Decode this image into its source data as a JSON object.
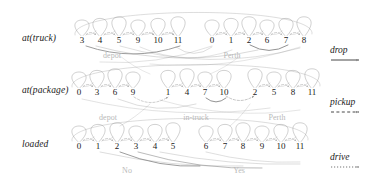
{
  "figure": {
    "type": "decision-diagram",
    "background": "#ffffff",
    "ink": "#1a1a1a",
    "edge_color": "#8c8c8c",
    "group_label_color": "#b9b9b9"
  },
  "rows": [
    {
      "id": "at-truck",
      "label": "at(truck)",
      "y": 40,
      "nodes": [
        {
          "v": "3",
          "x": 82
        },
        {
          "v": "4",
          "x": 100
        },
        {
          "v": "5",
          "x": 119
        },
        {
          "v": "9",
          "x": 138
        },
        {
          "v": "10",
          "x": 158
        },
        {
          "v": "11",
          "x": 178
        },
        {
          "v": "0",
          "x": 212
        },
        {
          "v": "1",
          "x": 231
        },
        {
          "v": "2",
          "x": 249
        },
        {
          "v": "6",
          "x": 267
        },
        {
          "v": "7",
          "x": 286
        },
        {
          "v": "8",
          "x": 304
        }
      ],
      "groups": [
        {
          "text": "depot",
          "x": 112,
          "y": 51
        },
        {
          "text": "Perth",
          "x": 232,
          "y": 51
        }
      ]
    },
    {
      "id": "at-package",
      "label": "at(package)",
      "y": 92,
      "nodes": [
        {
          "v": "0",
          "x": 79
        },
        {
          "v": "3",
          "x": 97
        },
        {
          "v": "6",
          "x": 115
        },
        {
          "v": "9",
          "x": 133
        },
        {
          "v": "1",
          "x": 168
        },
        {
          "v": "4",
          "x": 187
        },
        {
          "v": "7",
          "x": 205
        },
        {
          "v": "10",
          "x": 224
        },
        {
          "v": "2",
          "x": 255
        },
        {
          "v": "5",
          "x": 274
        },
        {
          "v": "8",
          "x": 293
        },
        {
          "v": "11",
          "x": 312
        }
      ],
      "groups": [
        {
          "text": "depot",
          "x": 108,
          "y": 113
        },
        {
          "text": "in-truck",
          "x": 196,
          "y": 113
        },
        {
          "text": "Perth",
          "x": 277,
          "y": 113
        }
      ]
    },
    {
      "id": "loaded",
      "label": "loaded",
      "y": 146,
      "nodes": [
        {
          "v": "0",
          "x": 79
        },
        {
          "v": "1",
          "x": 98
        },
        {
          "v": "2",
          "x": 117
        },
        {
          "v": "3",
          "x": 136
        },
        {
          "v": "4",
          "x": 155
        },
        {
          "v": "5",
          "x": 173
        },
        {
          "v": "6",
          "x": 206
        },
        {
          "v": "7",
          "x": 225
        },
        {
          "v": "8",
          "x": 243
        },
        {
          "v": "9",
          "x": 262
        },
        {
          "v": "10",
          "x": 281
        },
        {
          "v": "11",
          "x": 300
        }
      ],
      "groups": [
        {
          "text": "No",
          "x": 127,
          "y": 166
        },
        {
          "text": "Yes",
          "x": 239,
          "y": 166
        }
      ]
    }
  ],
  "legend": [
    {
      "id": "drop",
      "label": "drop",
      "style": "solid",
      "x": 330,
      "y": 45
    },
    {
      "id": "pickup",
      "label": "pickup",
      "style": "dashed",
      "x": 330,
      "y": 97
    },
    {
      "id": "drive",
      "label": "drive",
      "style": "dotted",
      "x": 330,
      "y": 152
    }
  ]
}
